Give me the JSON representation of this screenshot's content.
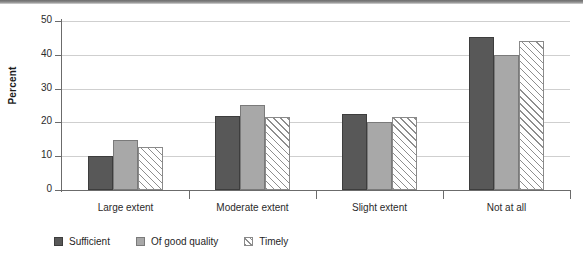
{
  "chart_data": {
    "type": "bar",
    "title": "",
    "xlabel": "",
    "ylabel": "Percent",
    "ylim": [
      0,
      50
    ],
    "yticks": [
      0,
      10,
      20,
      30,
      40,
      50
    ],
    "ytick_labels": [
      "0",
      "10",
      "20",
      "30",
      "40",
      "50"
    ],
    "grid": true,
    "legend_position": "bottom-left",
    "categories": [
      "Large extent",
      "Moderate extent",
      "Slight extent",
      "Not at all"
    ],
    "series": [
      {
        "name": "Sufficient",
        "color": "#585858",
        "fill": "solid-dark",
        "values": [
          10.0,
          21.8,
          22.4,
          45.3
        ]
      },
      {
        "name": "Of good quality",
        "color": "#a8a8a8",
        "fill": "solid-medium",
        "values": [
          14.8,
          25.1,
          20.0,
          40.0
        ]
      },
      {
        "name": "Timely",
        "color": "#ffffff",
        "fill": "diagonal-hatch",
        "values": [
          12.7,
          21.7,
          21.5,
          44.0
        ]
      }
    ]
  },
  "axis": {
    "y_label": "Percent"
  },
  "legend": {
    "items": [
      {
        "label": "Sufficient"
      },
      {
        "label": "Of good quality"
      },
      {
        "label": "Timely"
      }
    ]
  }
}
